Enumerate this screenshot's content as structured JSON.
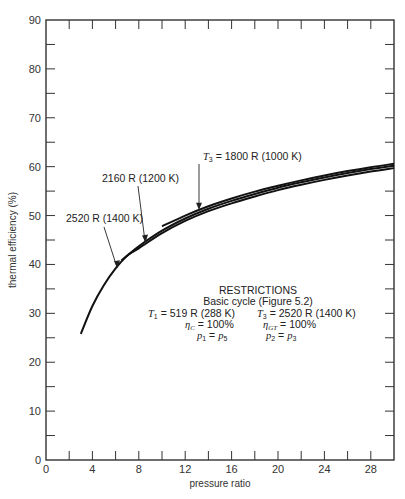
{
  "chart_data": {
    "type": "line",
    "title": "",
    "xlabel": "pressure ratio",
    "ylabel": "thermal efficiency (%)",
    "xlim": [
      0,
      30
    ],
    "ylim": [
      0,
      90
    ],
    "xticks": [
      0,
      4,
      8,
      12,
      16,
      20,
      24,
      28
    ],
    "yticks": [
      0,
      10,
      20,
      30,
      40,
      50,
      60,
      70,
      80,
      90
    ],
    "grid": false,
    "series": [
      {
        "name": "T3 = 1800 R (1000 K)",
        "label": "= 1800 R (1000 K)",
        "x": [
          10,
          12,
          14,
          16,
          18,
          20,
          22,
          24,
          26,
          28,
          30
        ],
        "y": [
          47.8,
          50.0,
          51.9,
          53.5,
          54.9,
          56.1,
          57.2,
          58.2,
          59.1,
          59.9,
          60.6
        ]
      },
      {
        "name": "2160 R (1200 K)",
        "label": "2160 R (1200 K)",
        "x": [
          6.5,
          8,
          10,
          12,
          14,
          16,
          18,
          20,
          22,
          24,
          26,
          28,
          30
        ],
        "y": [
          40.8,
          43.7,
          46.9,
          49.4,
          51.4,
          53.0,
          54.4,
          55.7,
          56.8,
          57.8,
          58.7,
          59.5,
          60.2
        ]
      },
      {
        "name": "2520 R (1400 K)",
        "label": "2520 R (1400 K)",
        "x": [
          3,
          4,
          5,
          6,
          7,
          8,
          10,
          12,
          14,
          16,
          18,
          20,
          22,
          24,
          26,
          28,
          30
        ],
        "y": [
          25.8,
          31.5,
          35.8,
          39.2,
          41.8,
          43.3,
          46.4,
          48.9,
          50.9,
          52.5,
          53.9,
          55.2,
          56.3,
          57.3,
          58.2,
          59.0,
          59.7
        ]
      }
    ],
    "annotations": {
      "restrictions_title": "RESTRICTIONS",
      "restrictions_subtitle": "Basic cycle (Figure 5.2)",
      "t1": "T₁ = 519 R (288 K)",
      "t3": "T₃ = 2520 R (1400 K)",
      "eta_c": "ηC = 100%",
      "eta_gt": "ηGT = 100%",
      "p1": "p₁ = p₅",
      "p2": "p₂ = p₃"
    }
  }
}
